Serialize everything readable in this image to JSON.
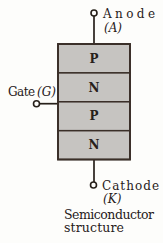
{
  "figure": {
    "caption": {
      "line1": "Semiconductor",
      "line2": "structure"
    },
    "terminals": {
      "anode": {
        "name": "Anode",
        "abbrev": "(A)"
      },
      "gate": {
        "name": "Gate",
        "abbrev": "(G)"
      },
      "cathode": {
        "name": "Cathode",
        "abbrev": "(K)"
      }
    },
    "layers": [
      {
        "label": "P"
      },
      {
        "label": "N"
      },
      {
        "label": "P"
      },
      {
        "label": "N"
      }
    ],
    "colors": {
      "layer_fill": "#c6c4c1",
      "outline": "#3a2f28",
      "text": "#27201a",
      "background": "#fdfdfb"
    }
  }
}
